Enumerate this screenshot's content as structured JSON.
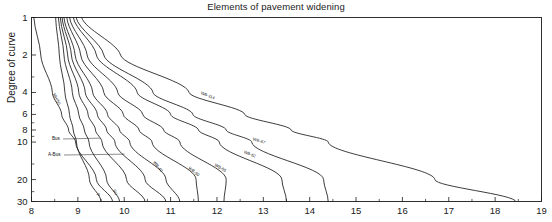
{
  "chart_data": {
    "type": "line",
    "title": "Elements of pavement widening",
    "xlabel": "",
    "ylabel": "Degree of curve",
    "xlim": [
      8,
      19
    ],
    "ylim": [
      1,
      30
    ],
    "yscale": "log-inverted",
    "grid": false,
    "legend_position": "inline-curve-labels",
    "xticks": [
      8,
      9,
      10,
      11,
      12,
      13,
      14,
      15,
      16,
      17,
      18,
      19
    ],
    "xtick_labels": [
      "8",
      "9",
      "10",
      "11",
      "12",
      "13",
      "14",
      "15",
      "16",
      "17",
      "18",
      "19"
    ],
    "yticks": [
      1,
      2,
      4,
      6,
      8,
      10,
      20,
      30
    ],
    "ytick_labels": [
      "1",
      "2",
      "4",
      "6",
      "8",
      "10",
      "20",
      "30"
    ],
    "y_minor_ticks": [
      3,
      5,
      7,
      9,
      15,
      25
    ],
    "series": [
      {
        "name": "MH/50",
        "label": "MH/50",
        "label_style": "rotated",
        "points": [
          [
            8.05,
            1
          ],
          [
            8.2,
            2
          ],
          [
            8.45,
            4
          ],
          [
            8.65,
            6
          ],
          [
            8.8,
            8
          ],
          [
            8.95,
            10
          ],
          [
            9.4,
            20
          ],
          [
            9.75,
            30
          ]
        ]
      },
      {
        "name": "P",
        "label": "P",
        "label_style": "rotated",
        "points": [
          [
            8.52,
            1
          ],
          [
            8.6,
            2
          ],
          [
            8.72,
            4
          ],
          [
            8.82,
            6
          ],
          [
            8.9,
            8
          ],
          [
            8.97,
            10
          ],
          [
            9.25,
            20
          ],
          [
            9.5,
            30
          ]
        ]
      },
      {
        "name": "SU",
        "label": "SU",
        "label_style": "rotated",
        "points": [
          [
            8.58,
            1
          ],
          [
            8.7,
            2
          ],
          [
            8.88,
            4
          ],
          [
            9.02,
            6
          ],
          [
            9.14,
            8
          ],
          [
            9.24,
            10
          ],
          [
            9.62,
            20
          ],
          [
            9.9,
            30
          ]
        ]
      },
      {
        "name": "Bus",
        "label": "Bus",
        "label_style": "callout",
        "points": [
          [
            8.62,
            1
          ],
          [
            8.78,
            2
          ],
          [
            9.02,
            4
          ],
          [
            9.22,
            6
          ],
          [
            9.38,
            8
          ],
          [
            9.52,
            10
          ],
          [
            10.05,
            20
          ],
          [
            10.45,
            30
          ]
        ]
      },
      {
        "name": "A-Bus",
        "label": "A-Bus",
        "label_style": "callout",
        "points": [
          [
            8.66,
            1
          ],
          [
            8.86,
            2
          ],
          [
            9.16,
            4
          ],
          [
            9.42,
            6
          ],
          [
            9.62,
            8
          ],
          [
            9.8,
            10
          ],
          [
            10.45,
            20
          ],
          [
            10.9,
            30
          ]
        ]
      },
      {
        "name": "WB-40",
        "label": "WB-40",
        "label_style": "rotated",
        "points": [
          [
            8.7,
            1
          ],
          [
            8.94,
            2
          ],
          [
            9.32,
            4
          ],
          [
            9.64,
            6
          ],
          [
            9.9,
            8
          ],
          [
            10.12,
            10
          ],
          [
            10.9,
            20
          ],
          [
            11.2,
            30
          ]
        ]
      },
      {
        "name": "WB-50",
        "label": "WB-50",
        "label_style": "rotated",
        "points": [
          [
            8.76,
            1
          ],
          [
            9.06,
            2
          ],
          [
            9.56,
            4
          ],
          [
            9.98,
            6
          ],
          [
            10.32,
            8
          ],
          [
            10.6,
            10
          ],
          [
            11.55,
            20
          ],
          [
            11.6,
            30
          ]
        ]
      },
      {
        "name": "WB-55",
        "label": "WB-55",
        "label_style": "rotated",
        "points": [
          [
            8.82,
            1
          ],
          [
            9.2,
            2
          ],
          [
            9.86,
            4
          ],
          [
            10.4,
            6
          ],
          [
            10.85,
            8
          ],
          [
            11.2,
            10
          ],
          [
            12.2,
            20
          ],
          [
            12.15,
            30
          ]
        ]
      },
      {
        "name": "WB-62",
        "label": "WB-62",
        "label_style": "rotated",
        "points": [
          [
            8.9,
            1
          ],
          [
            9.4,
            2
          ],
          [
            10.28,
            4
          ],
          [
            11.0,
            6
          ],
          [
            11.6,
            8
          ],
          [
            12.05,
            10
          ],
          [
            13.4,
            20
          ],
          [
            13.5,
            30
          ]
        ]
      },
      {
        "name": "WB-67",
        "label": "WB-67",
        "label_style": "rotated",
        "points": [
          [
            8.96,
            1
          ],
          [
            9.56,
            2
          ],
          [
            10.62,
            4
          ],
          [
            11.48,
            6
          ],
          [
            12.2,
            8
          ],
          [
            12.75,
            10
          ],
          [
            14.3,
            20
          ],
          [
            14.4,
            30
          ]
        ]
      },
      {
        "name": "WB-114",
        "label": "WB-114",
        "label_style": "rotated",
        "points": [
          [
            9.08,
            1
          ],
          [
            9.92,
            2
          ],
          [
            11.4,
            4
          ],
          [
            12.6,
            6
          ],
          [
            13.6,
            8
          ],
          [
            14.4,
            10
          ],
          [
            16.7,
            20
          ],
          [
            18.45,
            30
          ]
        ]
      }
    ],
    "annotations": [
      {
        "text": "Bus",
        "type": "leader-label",
        "target_curve": "Bus"
      },
      {
        "text": "A-Bus",
        "type": "leader-label",
        "target_curve": "A-Bus"
      }
    ]
  },
  "colors": {
    "line": "#1a1a1a",
    "axis": "#1a1a1a",
    "background": "#ffffff",
    "text": "#1a1a1a"
  }
}
